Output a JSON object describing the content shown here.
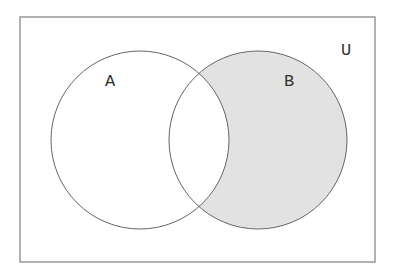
{
  "diagram": {
    "type": "venn",
    "title": "",
    "universe": {
      "label": "U",
      "rect": {
        "x": 20,
        "y": 17,
        "width": 355,
        "height": 245
      },
      "label_pos": {
        "x": 346,
        "y": 55
      },
      "stroke": "#888888"
    },
    "sets": [
      {
        "id": "A",
        "label": "A",
        "center": {
          "x": 140,
          "y": 140
        },
        "radius": 89,
        "label_pos": {
          "x": 110,
          "y": 86
        },
        "fill": "none"
      },
      {
        "id": "B",
        "label": "B",
        "center": {
          "x": 258,
          "y": 140
        },
        "radius": 89,
        "label_pos": {
          "x": 289,
          "y": 86
        },
        "fill": "#e2e2e2"
      }
    ],
    "shaded_region": {
      "description": "B minus A",
      "expression": "B − A",
      "color": "#e2e2e2"
    },
    "colors": {
      "outline": "#666666",
      "shade": "#e2e2e2",
      "background": "#ffffff",
      "label": "#333333"
    }
  }
}
